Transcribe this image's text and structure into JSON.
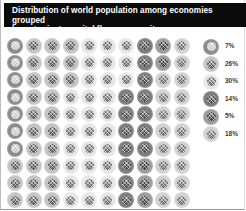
{
  "chart_data": {
    "type": "waffle",
    "title": "Distribution of world population among economies grouped by net private capital flows per capita",
    "grid": {
      "rows": 10,
      "cols": 10,
      "total_units": 100,
      "fill_order": "column-major"
    },
    "legend_position": "right",
    "series": [
      {
        "name": "7%",
        "label": "7%",
        "value": 7,
        "ring_color": "#8a8a8a",
        "core_color": "#c9c9c9"
      },
      {
        "name": "26%",
        "label": "26%",
        "value": 26,
        "ring_color": "#c4c4c4",
        "core_color": "#5a5a5a"
      },
      {
        "name": "30%",
        "label": "30%",
        "value": 30,
        "ring_color": "#e6e6e6",
        "core_color": "#6e6e6e"
      },
      {
        "name": "14%",
        "label": "14%",
        "value": 14,
        "ring_color": "#7c7c7c",
        "core_color": "#4a4a4a"
      },
      {
        "name": "5%",
        "label": "5%",
        "value": 5,
        "ring_color": "#9c9c9c",
        "core_color": "#3e3e3e"
      },
      {
        "name": "18%",
        "label": "18%",
        "value": 18,
        "ring_color": "#d2d2d2",
        "core_color": "#707070"
      }
    ],
    "xlabel": "",
    "ylabel": "",
    "grid_lines": false
  },
  "header": {
    "title_line1": "Distribution of world population among economies grouped",
    "title_line2": "by net private capital flows per capita"
  },
  "legend": {
    "items": [
      {
        "label": "7%"
      },
      {
        "label": "26%"
      },
      {
        "label": "30%"
      },
      {
        "label": "14%"
      },
      {
        "label": "5%"
      },
      {
        "label": "18%"
      }
    ]
  }
}
